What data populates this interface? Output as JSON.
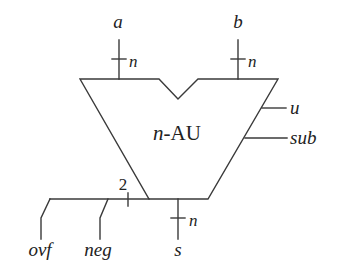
{
  "diagram": {
    "block": {
      "label_prefix": "n",
      "label_suffix": "-AU"
    },
    "inputs": [
      {
        "name": "a",
        "width_label": "n"
      },
      {
        "name": "b",
        "width_label": "n"
      }
    ],
    "control_inputs": [
      {
        "name": "u"
      },
      {
        "name": "sub"
      }
    ],
    "outputs": [
      {
        "name": "s",
        "width_label": "n"
      },
      {
        "name": "flags_bus",
        "width_label": "2"
      },
      {
        "name": "ovf"
      },
      {
        "name": "neg"
      }
    ],
    "colors": {
      "stroke": "#3a3a3a",
      "text": "#222222",
      "background": "#ffffff"
    }
  }
}
